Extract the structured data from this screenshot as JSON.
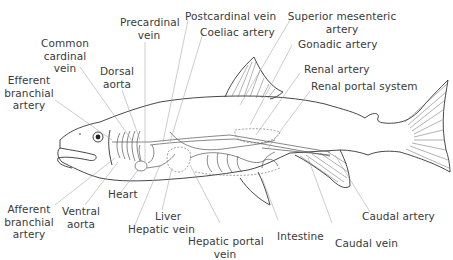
{
  "diagram": {
    "labels": {
      "precardinal_vein": "Precardinal\nvein",
      "postcardinal_vein": "Postcardinal vein",
      "coeliac_artery": "Coeliac artery",
      "superior_mesenteric_artery": "Superior mesenteric\nartery",
      "gonadic_artery": "Gonadic artery",
      "renal_artery": "Renal artery",
      "renal_portal_system": "Renal portal system",
      "common_cardinal_vein": "Common\ncardinal\nvein",
      "dorsal_aorta": "Dorsal\naorta",
      "efferent_branchial_artery": "Efferent\nbranchial\nartery",
      "afferent_branchial_artery": "Afferent\nbranchial\nartery",
      "ventral_aorta": "Ventral\naorta",
      "heart": "Heart",
      "liver": "Liver",
      "hepatic_vein": "Hepatic vein",
      "hepatic_portal_vein": "Hepatic portal\nvein",
      "intestine": "Intestine",
      "caudal_vein": "Caudal vein",
      "caudal_artery": "Caudal artery"
    }
  }
}
